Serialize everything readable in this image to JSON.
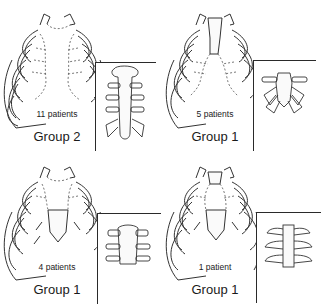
{
  "figure": {
    "panels": [
      {
        "id": "top-left",
        "patients_label": "11 patients",
        "group_label": "Group 2",
        "sternum": "absent-dashed",
        "inset": "long sternum with 6 rib pairs"
      },
      {
        "id": "top-right",
        "patients_label": "5 patients",
        "group_label": "Group 1",
        "sternum": "upper-manubrium-only",
        "inset": "short sternum with splayed lower ribs"
      },
      {
        "id": "bottom-left",
        "patients_label": "4 patients",
        "group_label": "Group 1",
        "sternum": "lower-xiphoid-only",
        "inset": "short sternal body with 3 rib pairs"
      },
      {
        "id": "bottom-right",
        "patients_label": "1 patient",
        "group_label": "Group 1",
        "sternum": "upper-and-lower-segments",
        "inset": "narrow sternal bar with 3 rib pairs"
      }
    ]
  }
}
